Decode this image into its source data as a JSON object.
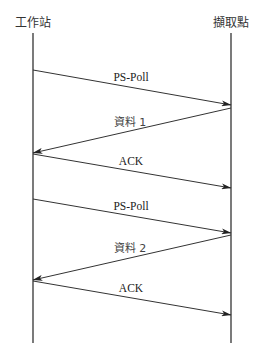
{
  "diagram": {
    "type": "sequence-diagram",
    "actors": [
      {
        "id": "station",
        "label": "工作站",
        "x": 33
      },
      {
        "id": "access_point",
        "label": "擷取點",
        "x": 231
      }
    ],
    "lifeline": {
      "top": 33,
      "bottom": 343
    },
    "messages": [
      {
        "label": "PS-Poll",
        "from": "station",
        "to": "access_point",
        "y1": 70,
        "y2": 105,
        "label_x": 131,
        "label_y": 71
      },
      {
        "label": "資料 1",
        "from": "access_point",
        "to": "station",
        "y1": 108,
        "y2": 153,
        "label_x": 130,
        "label_y": 116
      },
      {
        "label": "ACK",
        "from": "station",
        "to": "access_point",
        "y1": 154,
        "y2": 188,
        "label_x": 131,
        "label_y": 155
      },
      {
        "label": "PS-Poll",
        "from": "station",
        "to": "access_point",
        "y1": 199,
        "y2": 233,
        "label_x": 131,
        "label_y": 200
      },
      {
        "label": "資料 2",
        "from": "access_point",
        "to": "station",
        "y1": 235,
        "y2": 280,
        "label_x": 130,
        "label_y": 242
      },
      {
        "label": "ACK",
        "from": "station",
        "to": "access_point",
        "y1": 281,
        "y2": 315,
        "label_x": 131,
        "label_y": 282
      }
    ],
    "colors": {
      "line": "#333333",
      "text": "#222222",
      "background": "#ffffff"
    }
  }
}
